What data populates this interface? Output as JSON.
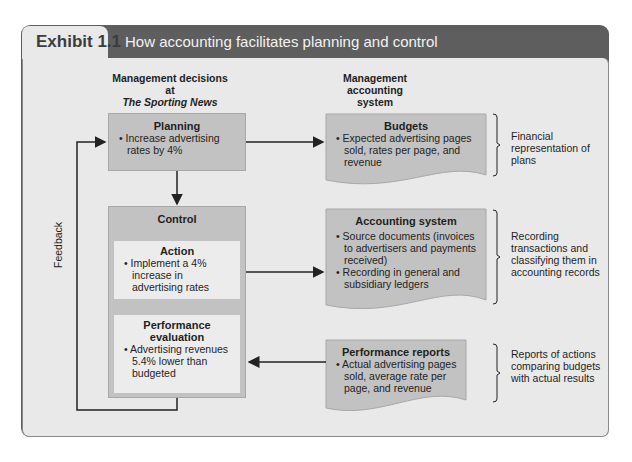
{
  "header": {
    "exhibit_label": "Exhibit 1.1",
    "title": "How accounting facilitates planning and control"
  },
  "columns": {
    "left": {
      "line1": "Management decisions",
      "line2": "at",
      "line3": "The Sporting News"
    },
    "right": {
      "line1": "Management",
      "line2": "accounting",
      "line3": "system"
    }
  },
  "planning": {
    "title": "Planning",
    "bullet": "Increase advertising rates by 4%"
  },
  "control": {
    "title": "Control",
    "action": {
      "title": "Action",
      "bullet": "Implement a 4% increase in advertising rates"
    },
    "evaluation": {
      "title_line1": "Performance",
      "title_line2": "evaluation",
      "bullet": "Advertising revenues 5.4% lower than budgeted"
    }
  },
  "budgets": {
    "title": "Budgets",
    "bullet": "Expected advertising pages sold, rates per page, and revenue"
  },
  "accounting_system": {
    "title": "Accounting system",
    "bullets": [
      "Source documents (invoices to advertisers and payments received)",
      "Recording in general and subsidiary ledgers"
    ]
  },
  "performance_reports": {
    "title": "Performance reports",
    "bullet": "Actual advertising pages sold, average rate per page, and revenue"
  },
  "notes": {
    "budgets": "Financial representation of plans",
    "accounting": "Recording transactions and classifying them in accounting records",
    "reports": "Reports of actions comparing budgets with actual results"
  },
  "feedback_label": "Feedback",
  "colors": {
    "frame": "#5e5e5e",
    "panel": "#e9e9e9",
    "box": "#c2c2c2",
    "inner": "#ececec"
  }
}
